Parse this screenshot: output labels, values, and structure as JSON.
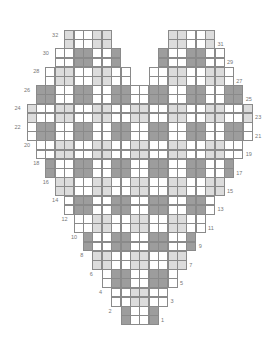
{
  "grid": {
    "columns": 24,
    "origin_x": 26.5,
    "origin_y": 30,
    "cell_w": 9.4,
    "cell_h": 9.2,
    "total_rows": 32
  },
  "colors": {
    "dark": "#9d9d9d",
    "light": "#dcdcdc",
    "white": "#ffffff",
    "gridline": "#8a8a8a",
    "label": "#777777"
  },
  "pattern": {
    "description": "2x2 gingham blocks: even row-bands dark on odd column-blocks; odd row-bands light on even column-blocks",
    "dark_columns": [
      1,
      2,
      5,
      6,
      9,
      10,
      13,
      14,
      17,
      18,
      21,
      22
    ]
  },
  "rows": [
    {
      "row": 1,
      "label": "1",
      "label_side": "right",
      "spans": [
        [
          10,
          13
        ]
      ]
    },
    {
      "row": 2,
      "label": "2",
      "label_side": "left",
      "spans": [
        [
          10,
          13
        ]
      ]
    },
    {
      "row": 3,
      "label": "3",
      "label_side": "right",
      "spans": [
        [
          9,
          14
        ]
      ]
    },
    {
      "row": 4,
      "label": "4",
      "label_side": "left",
      "spans": [
        [
          9,
          14
        ]
      ]
    },
    {
      "row": 5,
      "label": "5",
      "label_side": "right",
      "spans": [
        [
          8,
          15
        ]
      ]
    },
    {
      "row": 6,
      "label": "6",
      "label_side": "left",
      "spans": [
        [
          8,
          15
        ]
      ]
    },
    {
      "row": 7,
      "label": "7",
      "label_side": "right",
      "spans": [
        [
          7,
          16
        ]
      ]
    },
    {
      "row": 8,
      "label": "8",
      "label_side": "left",
      "spans": [
        [
          7,
          16
        ]
      ]
    },
    {
      "row": 9,
      "label": "9",
      "label_side": "right",
      "spans": [
        [
          6,
          17
        ]
      ]
    },
    {
      "row": 10,
      "label": "10",
      "label_side": "left",
      "spans": [
        [
          6,
          17
        ]
      ]
    },
    {
      "row": 11,
      "label": "11",
      "label_side": "right",
      "spans": [
        [
          5,
          18
        ]
      ]
    },
    {
      "row": 12,
      "label": "12",
      "label_side": "left",
      "spans": [
        [
          5,
          18
        ]
      ]
    },
    {
      "row": 13,
      "label": "13",
      "label_side": "right",
      "spans": [
        [
          4,
          19
        ]
      ]
    },
    {
      "row": 14,
      "label": "14",
      "label_side": "left",
      "spans": [
        [
          4,
          19
        ]
      ]
    },
    {
      "row": 15,
      "label": "15",
      "label_side": "right",
      "spans": [
        [
          3,
          20
        ]
      ]
    },
    {
      "row": 16,
      "label": "16",
      "label_side": "left",
      "spans": [
        [
          3,
          20
        ]
      ]
    },
    {
      "row": 17,
      "label": "17",
      "label_side": "right",
      "spans": [
        [
          2,
          21
        ]
      ]
    },
    {
      "row": 18,
      "label": "18",
      "label_side": "left",
      "spans": [
        [
          2,
          21
        ]
      ]
    },
    {
      "row": 19,
      "label": "19",
      "label_side": "right",
      "spans": [
        [
          1,
          22
        ]
      ]
    },
    {
      "row": 20,
      "label": "20",
      "label_side": "left",
      "spans": [
        [
          1,
          22
        ]
      ]
    },
    {
      "row": 21,
      "label": "21",
      "label_side": "right",
      "spans": [
        [
          0,
          23
        ]
      ]
    },
    {
      "row": 22,
      "label": "22",
      "label_side": "left",
      "spans": [
        [
          0,
          23
        ]
      ]
    },
    {
      "row": 23,
      "label": "23",
      "label_side": "right",
      "spans": [
        [
          0,
          23
        ]
      ]
    },
    {
      "row": 24,
      "label": "24",
      "label_side": "left",
      "spans": [
        [
          0,
          23
        ]
      ]
    },
    {
      "row": 25,
      "label": "25",
      "label_side": "right",
      "spans": [
        [
          1,
          22
        ]
      ]
    },
    {
      "row": 26,
      "label": "26",
      "label_side": "left",
      "spans": [
        [
          1,
          22
        ]
      ]
    },
    {
      "row": 27,
      "label": "27",
      "label_side": "right",
      "spans": [
        [
          2,
          10
        ],
        [
          13,
          21
        ]
      ]
    },
    {
      "row": 28,
      "label": "28",
      "label_side": "left",
      "spans": [
        [
          2,
          10
        ],
        [
          13,
          21
        ]
      ]
    },
    {
      "row": 29,
      "label": "29",
      "label_side": "right",
      "spans": [
        [
          3,
          9
        ],
        [
          14,
          20
        ]
      ]
    },
    {
      "row": 30,
      "label": "30",
      "label_side": "left",
      "spans": [
        [
          3,
          9
        ],
        [
          14,
          20
        ]
      ]
    },
    {
      "row": 31,
      "label": "31",
      "label_side": "right",
      "spans": [
        [
          4,
          8
        ],
        [
          15,
          19
        ]
      ]
    },
    {
      "row": 32,
      "label": "32",
      "label_side": "left",
      "spans": [
        [
          4,
          8
        ],
        [
          15,
          19
        ]
      ]
    }
  ]
}
